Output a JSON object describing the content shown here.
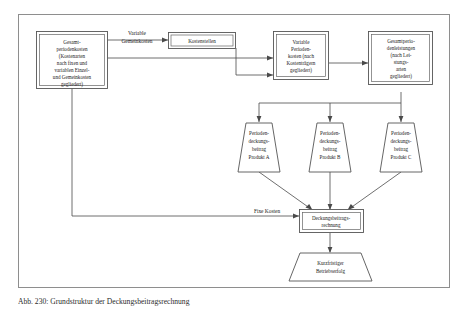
{
  "figure": {
    "caption": "Abb. 230: Grundstruktur der Deckungsbeitragsrechnung"
  },
  "nodes": {
    "gesamtperiodenkosten": {
      "lines": [
        "Gesamt-",
        "periodenkosten",
        "(Kostenarten",
        "nach fixen und",
        "variablen Einzel-",
        "und Gemeinkosten",
        "gegliedert)"
      ]
    },
    "kostenstellen": {
      "lines": [
        "Kostenstellen"
      ]
    },
    "variable_periodenkosten": {
      "lines": [
        "Variable",
        "Perioden-",
        "kosten (nach",
        "Kostenträgern",
        "gegliedert)"
      ]
    },
    "gesamtperiodenleistungen": {
      "lines": [
        "Gesamtperio-",
        "denleistungen",
        "(nach Lei-",
        "stungs-",
        "arten",
        "gegliedert)"
      ]
    },
    "db_produkt_a": {
      "lines": [
        "Perioden-",
        "deckungs-",
        "beitrag",
        "Produkt A"
      ]
    },
    "db_produkt_b": {
      "lines": [
        "Perioden-",
        "deckungs-",
        "beitrag",
        "Produkt B"
      ]
    },
    "db_produkt_c": {
      "lines": [
        "Perioden-",
        "deckungs-",
        "beitrag",
        "Produkt C"
      ]
    },
    "deckungsbeitragsrechnung": {
      "lines": [
        "Deckungsbeitrags-",
        "rechnung"
      ]
    },
    "kurzfristiger_betriebserfolg": {
      "lines": [
        "Kurzfristiger",
        "Betriebserfolg"
      ]
    }
  },
  "edge_labels": {
    "variable_gemeinkosten": {
      "lines": [
        "Variable",
        "Gemeinkosten"
      ]
    },
    "fixe_kosten": {
      "lines": [
        "Fixe Kosten"
      ]
    }
  },
  "colors": {
    "frame_stroke": "#8e8e8e",
    "node_stroke": "#555555",
    "connector_stroke": "#4a4a4a",
    "text": "#1a1a1a",
    "background": "#ffffff"
  }
}
